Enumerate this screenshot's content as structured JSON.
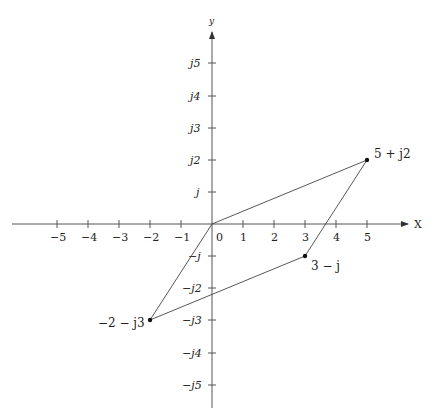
{
  "axes": {
    "x_label": "X",
    "y_label": "y",
    "x_ticks": [
      "−5",
      "−4",
      "−3",
      "−2",
      "−1",
      "0",
      "1",
      "2",
      "3",
      "4",
      "5"
    ],
    "y_ticks_pos": [
      "j",
      "j2",
      "j3",
      "j4",
      "j5"
    ],
    "y_ticks_neg": [
      "−j",
      "−j2",
      "−j3",
      "−j4",
      "−j5"
    ]
  },
  "points": [
    {
      "label": "5 + j2",
      "re": 5,
      "im": 2
    },
    {
      "label": "3 − j",
      "re": 3,
      "im": -1
    },
    {
      "label": "−2 − j3",
      "re": -2,
      "im": -3
    },
    {
      "label": "0",
      "re": 0,
      "im": 0
    }
  ],
  "colors": {
    "axis": "#555555",
    "line": "#444444",
    "point": "#111111"
  }
}
